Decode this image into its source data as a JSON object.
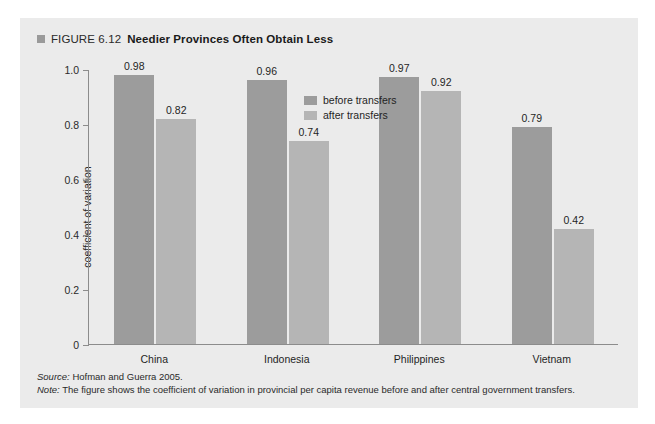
{
  "figure": {
    "marker_icon": "square-marker-icon",
    "figure_number": "FIGURE 6.12",
    "title": "Needier Provinces Often Obtain Less",
    "source_key": "Source:",
    "source_text": " Hofman and Guerra 2005.",
    "note_key": "Note:",
    "note_text": " The figure shows the coefficient of variation in provincial per capita revenue before and after central government transfers."
  },
  "colors": {
    "panel_background": "#ebebeb",
    "before_transfers_bar": "#9c9c9c",
    "after_transfers_bar": "#b5b5b5",
    "axis": "#8c8c8c",
    "text": "#1f1f1f"
  },
  "chart_data": {
    "type": "bar",
    "title": "Needier Provinces Often Obtain Less",
    "xlabel": "",
    "ylabel": "coefficient of variation",
    "ylim": [
      0,
      1.0
    ],
    "yticks": [
      "0",
      "0.2",
      "0.4",
      "0.6",
      "0.8",
      "1.0"
    ],
    "ytick_values": [
      0,
      0.2,
      0.4,
      0.6,
      0.8,
      1.0
    ],
    "grid": false,
    "legend_position": "inside-top-center",
    "categories": [
      "China",
      "Indonesia",
      "Philippines",
      "Vietnam"
    ],
    "series": [
      {
        "name": "before transfers",
        "values": [
          0.98,
          0.96,
          0.97,
          0.79
        ],
        "labels": [
          "0.98",
          "0.96",
          "0.97",
          "0.79"
        ]
      },
      {
        "name": "after transfers",
        "values": [
          0.82,
          0.74,
          0.92,
          0.42
        ],
        "labels": [
          "0.82",
          "0.74",
          "0.92",
          "0.42"
        ]
      }
    ]
  }
}
